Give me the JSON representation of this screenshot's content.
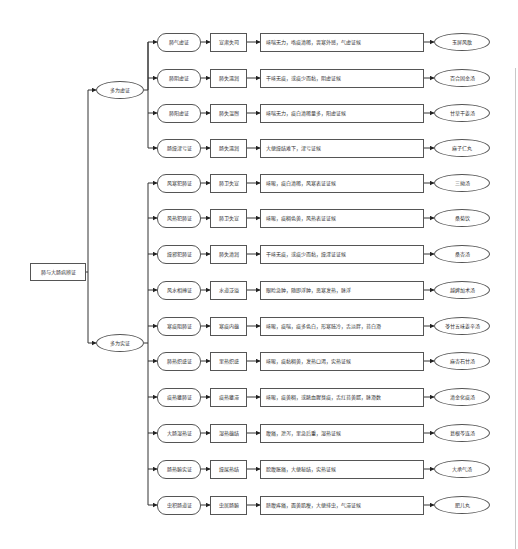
{
  "diagram": {
    "root": "肺与大肠病辨证",
    "groups": [
      {
        "label": "多为虚证",
        "rows": [
          {
            "pattern": "肺气虚证",
            "mechanism": "宣肃失司",
            "symptoms": "咳喘无力，咯痰清稀，畏寒外感，气虚证候",
            "formula": "玉屏风散"
          },
          {
            "pattern": "肺阴虚证",
            "mechanism": "肺失濡润",
            "symptoms": "干咳无痰，或痰少而黏，阴虚证候",
            "formula": "百合固金汤"
          },
          {
            "pattern": "肺阳虚证",
            "mechanism": "肺失温煦",
            "symptoms": "咳喘无力，痰白清稀量多，阳虚证候",
            "formula": "甘草干姜汤"
          },
          {
            "pattern": "肠燥津亏证",
            "mechanism": "肠失濡润",
            "symptoms": "大便燥结难下，津亏证候",
            "formula": "麻子仁丸"
          }
        ]
      },
      {
        "label": "多为实证",
        "rows": [
          {
            "pattern": "风寒犯肺证",
            "mechanism": "肺卫失宣",
            "symptoms": "咳嗽，痰白清稀，风寒表证证候",
            "formula": "三拗汤"
          },
          {
            "pattern": "风热犯肺证",
            "mechanism": "肺卫失宣",
            "symptoms": "咳嗽，痰稠色黄，风热表证证候",
            "formula": "桑菊饮"
          },
          {
            "pattern": "燥邪犯肺证",
            "mechanism": "肺失清润",
            "symptoms": "干咳无痰，或痰少而黏，燥淫证证候",
            "formula": "桑杏汤"
          },
          {
            "pattern": "风水相搏证",
            "mechanism": "水道泛溢",
            "symptoms": "眼睑急肿，随即浮肿，恶寒发热，脉浮",
            "formula": "越婢加术汤"
          },
          {
            "pattern": "寒痰阻肺证",
            "mechanism": "寒痰内蕴",
            "symptoms": "咳嗽，痰喘，痰多色白，形寒肢冷，舌淡胖，苔白滑",
            "formula": "苓甘五味姜辛汤"
          },
          {
            "pattern": "肺热炽盛证",
            "mechanism": "里热炽盛",
            "symptoms": "咳嗽，痰黏稠黄，发热口渴，实热证候",
            "formula": "麻杏石甘汤"
          },
          {
            "pattern": "痰热壅肺证",
            "mechanism": "痰热壅滞",
            "symptoms": "咳嗽，痰黄稠，或脓血腥臭痰，舌红苔黄腻，脉滑数",
            "formula": "清金化痰汤"
          },
          {
            "pattern": "大肠湿热证",
            "mechanism": "湿热蕴结",
            "symptoms": "腹痛，泄泻，里急后重，湿热证候",
            "formula": "葛根芩连汤"
          },
          {
            "pattern": "肠热腑实证",
            "mechanism": "燥屎热结",
            "symptoms": "脘腹胀痛，大便秘结，实热证候",
            "formula": "大承气汤"
          },
          {
            "pattern": "虫积肠道证",
            "mechanism": "虫居肠腑",
            "symptoms": "脐腹疼痛，面黄肌瘦，大便排虫，气滞证候",
            "formula": "肥儿丸"
          }
        ]
      }
    ]
  }
}
